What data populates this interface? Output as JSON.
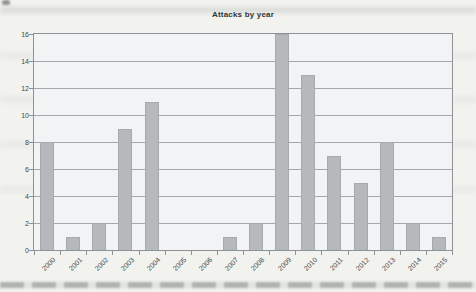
{
  "page": {
    "background": "#f2f2ee"
  },
  "chart_data": {
    "type": "bar",
    "title": "Attacks by year",
    "categories": [
      "2000",
      "2001",
      "2002",
      "2003",
      "2004",
      "2005",
      "2006",
      "2007",
      "2008",
      "2009",
      "2010",
      "2011",
      "2012",
      "2013",
      "2014",
      "2015"
    ],
    "values": [
      8,
      1,
      2,
      9,
      11,
      0,
      0,
      1,
      2,
      16,
      13,
      7,
      5,
      8,
      2,
      1
    ],
    "xlabel": "",
    "ylabel": "",
    "ylim": [
      0,
      16
    ],
    "ytick_step": 2,
    "y_tick_labels": [
      "0",
      "2",
      "4",
      "6",
      "8",
      "10",
      "12",
      "14",
      "16"
    ],
    "grid": true,
    "legend": false,
    "colors": {
      "bar": "#b6b9bc",
      "bar_edge": "#a7abae",
      "grid": "#a3a8ab",
      "border": "#8d9295",
      "text": "#45484a",
      "title_text": "#333537",
      "plot_background": "#f1f3f4",
      "page_background": "#f2f2ee"
    }
  }
}
